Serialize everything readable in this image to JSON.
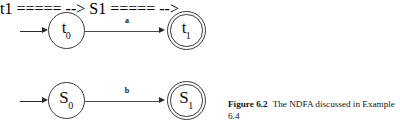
{
  "figure": {
    "caption_number": "Figure 6.2",
    "caption_text": "The NDFA discussed in Example 6.4"
  },
  "colors": {
    "stroke": "#3a3a3a",
    "arrow": "#2b2b2b",
    "text": "#111111",
    "background": "#ffffff"
  },
  "automata": [
    {
      "id": "automaton-t",
      "start_state": {
        "base": "t",
        "subscript": "0",
        "accepting": false
      },
      "accept_state": {
        "base": "t",
        "subscript": "1",
        "accepting": true
      },
      "transition_label": "a"
    },
    {
      "id": "automaton-s",
      "start_state": {
        "base": "S",
        "subscript": "0",
        "accepting": false
      },
      "accept_state": {
        "base": "S",
        "subscript": "1",
        "accepting": true
      },
      "transition_label": "b"
    }
  ]
}
